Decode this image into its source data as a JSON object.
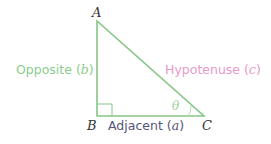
{
  "diagram": {
    "type": "right-triangle",
    "vertices": {
      "A": {
        "label": "A"
      },
      "B": {
        "label": "B"
      },
      "C": {
        "label": "C"
      }
    },
    "angle_label": "θ",
    "sides": {
      "opposite": {
        "label": "Opposite",
        "var": "b",
        "open": "(",
        "close": ")"
      },
      "adjacent": {
        "label": "Adjacent",
        "var": "a",
        "open": "(",
        "close": ")"
      },
      "hypotenuse": {
        "label": "Hypotenuse",
        "var": "c",
        "open": "(",
        "close": ")"
      }
    },
    "colors": {
      "line": "#86c686",
      "opposite_text": "#8ccc8c",
      "hypotenuse_text": "#e89ac8",
      "adjacent_text": "#555577",
      "vertex_text": "#333333"
    }
  }
}
